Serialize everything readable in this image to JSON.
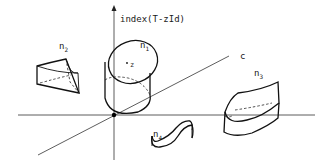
{
  "diagram": {
    "axes": {
      "vertical_label": "index(T-zId)",
      "diagonal_label": "c"
    },
    "objects": [
      {
        "id": "n1",
        "label": "n",
        "subscript": "1",
        "shape": "cylinder",
        "point_label": "z"
      },
      {
        "id": "n2",
        "label": "n",
        "subscript": "2",
        "shape": "curved-wedge"
      },
      {
        "id": "n3",
        "label": "n",
        "subscript": "3",
        "shape": "flat-curved-slab"
      },
      {
        "id": "n4",
        "label": "n",
        "subscript": "4",
        "shape": "s-curve-ribbon"
      }
    ]
  }
}
